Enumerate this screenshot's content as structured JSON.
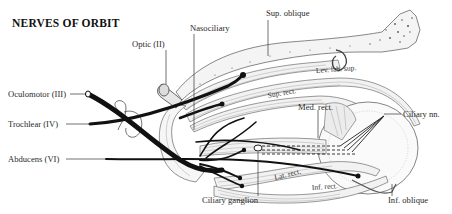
{
  "title": "NERVES OF ORBIT",
  "labels": {
    "optic": "Optic (II)",
    "nasociliary": "Nasociliary",
    "sup_oblique": "Sup. oblique",
    "lev_lab_sup": "Lev. lab. sup.",
    "sup_rect": "Sup. rect.",
    "med_rect": "Med. rect.",
    "ciliary_nn": "Ciliary nn.",
    "oculomotor": "Oculomotor (III)",
    "trochlear": "Trochlear (IV)",
    "abducens": "Abducens (VI)",
    "ciliary_ganglion": "Ciliary ganglion",
    "lat_rect": "Lat. rect.",
    "inf_rect": "Inf. rect.",
    "inf_oblique": "Inf. oblique"
  },
  "colors": {
    "ink": "#111111",
    "paper": "#ffffff",
    "label": "#2a2a2a"
  }
}
